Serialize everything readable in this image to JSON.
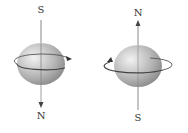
{
  "diagrams": [
    {
      "name": "left-spin",
      "top_label": "S",
      "bottom_label": "N",
      "rotation": "counterclockwise-arrow-right"
    },
    {
      "name": "right-spin",
      "top_label": "N",
      "bottom_label": "S",
      "rotation": "clockwise-arrow-left"
    }
  ],
  "colors": {
    "axis": "#777777",
    "sphere_light": "#e8e8e8",
    "sphere_dark": "#8c8c8c",
    "ring": "#444444"
  }
}
